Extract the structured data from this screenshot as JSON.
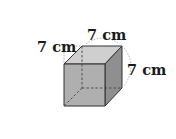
{
  "figure": {
    "shape": "cube",
    "edge_length": 7,
    "unit": "cm",
    "labels": {
      "left": "7 cm",
      "top": "7 cm",
      "right": "7 cm"
    },
    "colors": {
      "front_face": "#a8a8a8",
      "top_face": "#cfcfcf",
      "side_face": "#8f8f8f",
      "edge": "#333333",
      "hidden_edge": "#444444",
      "dimension_guide": "#9a9a9a",
      "label_text": "#1a1a1a"
    }
  }
}
